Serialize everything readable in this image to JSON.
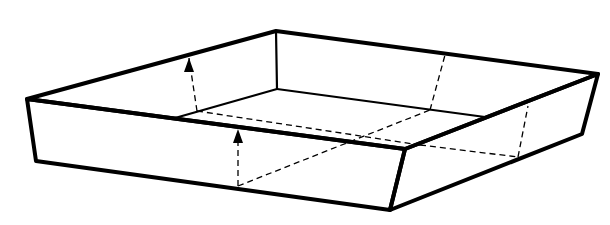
{
  "diagram": {
    "colors": {
      "stroke": "#000000",
      "background": "#ffffff"
    },
    "outer_top_edges": [
      [
        27,
        99
      ],
      [
        276,
        31
      ],
      [
        598,
        74
      ],
      [
        405,
        149
      ],
      [
        27,
        99
      ]
    ],
    "front_left_face": [
      [
        27,
        99
      ],
      [
        36,
        161
      ],
      [
        390,
        210
      ],
      [
        405,
        149
      ]
    ],
    "front_right_face": [
      [
        405,
        149
      ],
      [
        390,
        210
      ],
      [
        582,
        134
      ],
      [
        598,
        74
      ]
    ],
    "back_corner_vertical": [
      [
        276,
        31
      ],
      [
        277,
        89
      ]
    ],
    "inner_floor_edges": [
      [
        [
          175,
          118
        ],
        [
          277,
          89
        ]
      ],
      [
        [
          277,
          89
        ],
        [
          485,
          117
        ]
      ]
    ],
    "dashed_fold_lines": [
      [
        [
          197,
          111
        ],
        [
          189,
          58
        ]
      ],
      [
        [
          238,
          186
        ],
        [
          238,
          140
        ]
      ],
      [
        [
          238,
          186
        ],
        [
          430,
          110
        ]
      ],
      [
        [
          197,
          111
        ],
        [
          420,
          145
        ]
      ],
      [
        [
          430,
          110
        ],
        [
          445,
          55
        ]
      ],
      [
        [
          420,
          145
        ],
        [
          518,
          157
        ]
      ],
      [
        [
          518,
          157
        ],
        [
          528,
          106
        ]
      ]
    ],
    "arrows": [
      {
        "name": "back-flap-arrow",
        "tip": [
          189,
          58
        ],
        "direction": "up"
      },
      {
        "name": "front-flap-arrow",
        "tip": [
          238,
          129
        ],
        "direction": "up"
      }
    ]
  }
}
